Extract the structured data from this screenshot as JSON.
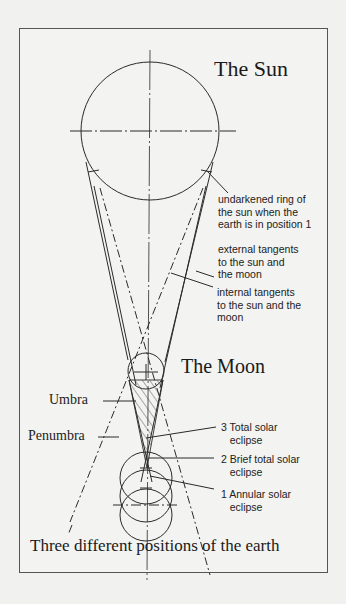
{
  "diagram": {
    "title_sun": "The Sun",
    "title_moon": "The Moon",
    "caption": "Three different positions of the earth",
    "labels": {
      "undarkened_ring": "undarkened ring of\nthe sun when the\nearth is in position 1",
      "external_tangents": "external tangents\nto the sun and\nthe moon",
      "internal_tangents": "internal tangents\nto the sun and the\nmoon",
      "umbra": "Umbra",
      "penumbra": "Penumbra",
      "position_3": "3 Total solar\n   eclipse",
      "position_2": "2 Brief total solar\n   eclipse",
      "position_1": "1 Annular solar\n   eclipse"
    },
    "colors": {
      "background": "#f1f1ef",
      "line": "#2a2a2a",
      "frame": "#555555"
    }
  }
}
